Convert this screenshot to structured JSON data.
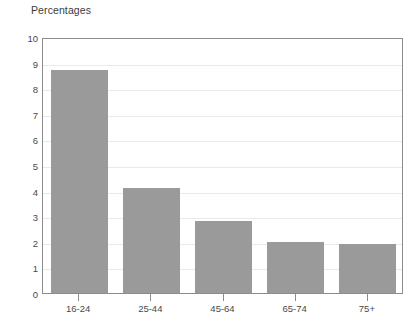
{
  "chart_data": {
    "type": "bar",
    "title": "Percentages",
    "xlabel": "",
    "ylabel": "",
    "categories": [
      "16-24",
      "25-44",
      "45-64",
      "65-74",
      "75+"
    ],
    "values": [
      8.7,
      4.1,
      2.8,
      2.0,
      1.9
    ],
    "ylim": [
      0,
      10
    ],
    "y_ticks": [
      0,
      1,
      2,
      3,
      4,
      5,
      6,
      7,
      8,
      9,
      10
    ],
    "y_tick_labels": [
      "0",
      "1",
      "2",
      "3",
      "4",
      "5",
      "6",
      "7",
      "8",
      "9",
      "10"
    ],
    "grid": true,
    "grid_axis": "y",
    "legend": false,
    "bar_color": "#9a9a9a",
    "frame_color": "#8c8c8c",
    "grid_color": "#e9e9e9",
    "text_color": "#4a4a4a"
  }
}
